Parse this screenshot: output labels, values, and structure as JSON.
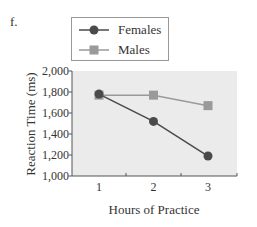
{
  "panel_label": "f.",
  "legend": {
    "items": [
      {
        "label": "Females",
        "marker": "circle",
        "color": "#4a4a4a"
      },
      {
        "label": "Males",
        "marker": "square",
        "color": "#9a9a9a"
      }
    ]
  },
  "axes": {
    "xlabel": "Hours of Practice",
    "ylabel": "Reaction Time (ms)",
    "xticks": [
      "1",
      "2",
      "3"
    ],
    "yticks": [
      "1,000",
      "1,200",
      "1,400",
      "1,600",
      "1,800",
      "2,000"
    ]
  },
  "chart_data": {
    "type": "line",
    "title": "",
    "xlabel": "Hours of Practice",
    "ylabel": "Reaction Time (ms)",
    "x": [
      1,
      2,
      3
    ],
    "series": [
      {
        "name": "Females",
        "values": [
          1780,
          1520,
          1190
        ],
        "marker": "circle",
        "color": "#4a4a4a"
      },
      {
        "name": "Males",
        "values": [
          1770,
          1770,
          1670
        ],
        "marker": "square",
        "color": "#9a9a9a"
      }
    ],
    "ylim": [
      1000,
      2000
    ],
    "yticks": [
      1000,
      1200,
      1400,
      1600,
      1800,
      2000
    ],
    "xticks": [
      1,
      2,
      3
    ],
    "grid": false,
    "legend_position": "top (above plot)",
    "plot_background": "#ebebeb"
  }
}
